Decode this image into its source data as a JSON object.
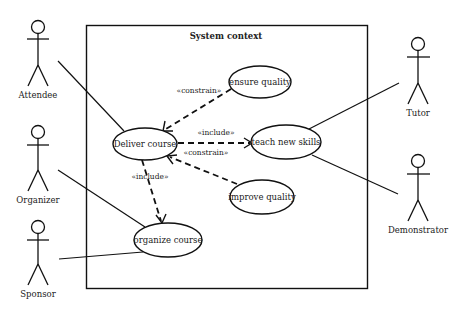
{
  "diagram": {
    "type": "uml-use-case",
    "system": {
      "title": "System context",
      "box": {
        "x": 86,
        "y": 25,
        "width": 281,
        "height": 263
      }
    },
    "actors": [
      {
        "id": "attendee",
        "label": "Attendee",
        "x": 38,
        "head_y": 27
      },
      {
        "id": "organizer",
        "label": "Organizer",
        "x": 38,
        "head_y": 132
      },
      {
        "id": "sponsor",
        "label": "Sponsor",
        "x": 38,
        "head_y": 227
      },
      {
        "id": "tutor",
        "label": "Tutor",
        "x": 418,
        "head_y": 44
      },
      {
        "id": "demonstrator",
        "label": "Demonstrator",
        "x": 418,
        "head_y": 161
      }
    ],
    "use_cases": [
      {
        "id": "deliver",
        "label": "Deliver course",
        "cx": 145,
        "cy": 144,
        "rx": 32,
        "ry": 16
      },
      {
        "id": "ensure",
        "label": "ensure quality",
        "cx": 260,
        "cy": 82,
        "rx": 31,
        "ry": 16
      },
      {
        "id": "teach",
        "label": "teach new skills",
        "cx": 286,
        "cy": 142,
        "rx": 35,
        "ry": 17
      },
      {
        "id": "improve",
        "label": "improve quality",
        "cx": 262,
        "cy": 197,
        "rx": 32,
        "ry": 17
      },
      {
        "id": "organize",
        "label": "organize course",
        "cx": 168,
        "cy": 240,
        "rx": 34,
        "ry": 17
      }
    ],
    "associations": [
      {
        "from": "attendee",
        "to": "deliver"
      },
      {
        "from": "organizer",
        "to": "organize"
      },
      {
        "from": "sponsor",
        "to": "organize"
      },
      {
        "from": "tutor",
        "to": "teach"
      },
      {
        "from": "demonstrator",
        "to": "teach"
      }
    ],
    "dependencies": [
      {
        "from": "ensure",
        "to": "deliver",
        "stereotype": "«constrain»"
      },
      {
        "from": "deliver",
        "to": "teach",
        "stereotype": "«include»"
      },
      {
        "from": "improve",
        "to": "deliver",
        "stereotype": "«constrain»"
      },
      {
        "from": "deliver",
        "to": "organize",
        "stereotype": "«include»"
      }
    ],
    "colors": {
      "line": "#111111",
      "text": "#222222",
      "background": "#ffffff"
    }
  }
}
